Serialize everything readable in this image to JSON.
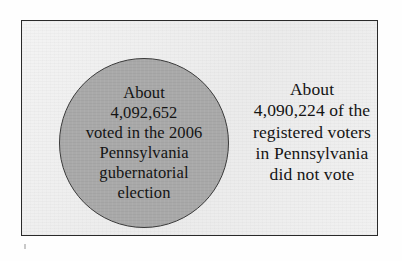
{
  "figure": {
    "circle": {
      "label": "voted-circle",
      "fill_color": "#a9a9a9",
      "border_color": "#3a3a3a",
      "lines": [
        "About",
        "4,092,652",
        "voted in the 2006",
        "Pennsylvania",
        "gubernatorial",
        "election"
      ],
      "value": "4,092,652",
      "category": "Voted in the 2006 Pennsylvania gubernatorial election"
    },
    "right_text": {
      "label": "did-not-vote-text",
      "lines": [
        "About",
        "4,090,224 of the",
        "registered voters",
        "in Pennsylvania",
        "did not vote"
      ],
      "value": "4,090,224",
      "category": "Registered voters in Pennsylvania who did not vote"
    },
    "frame": {
      "background_color": "#efefef",
      "border_color": "#2a2a2a"
    }
  },
  "chart_data": {
    "type": "pie",
    "title": "",
    "subtitle": "",
    "xlabel": "",
    "ylabel": "",
    "grid": false,
    "legend_position": "none",
    "categories": [
      "Voted in the 2006 Pennsylvania gubernatorial election",
      "Registered voters in Pennsylvania who did not vote"
    ],
    "values": [
      4092652,
      4090224
    ],
    "value_labels": [
      "4,092,652",
      "4,090,224"
    ],
    "annotations": [
      "About 4,092,652 voted in the 2006 Pennsylvania gubernatorial election",
      "About 4,090,224 of the registered voters in Pennsylvania did not vote"
    ],
    "colors": [
      "#a9a9a9",
      "#efefef"
    ]
  }
}
